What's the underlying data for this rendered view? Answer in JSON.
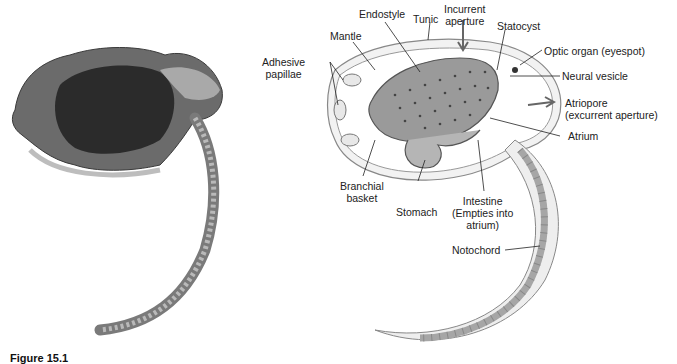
{
  "figure": {
    "caption": "Figure 15.1",
    "photo": {
      "description": "micrograph of tunicate larva"
    },
    "diagram": {
      "labels": {
        "adhesive_papillae": [
          "Adhesive",
          "papillae"
        ],
        "mantle": "Mantle",
        "endostyle": "Endostyle",
        "tunic": "Tunic",
        "incurrent_aperture": [
          "Incurrent",
          "aperture"
        ],
        "statocyst": "Statocyst",
        "optic_organ": "Optic organ (eyespot)",
        "neural_vesicle": "Neural vesicle",
        "atriopore": [
          "Atriopore",
          "(excurrent aperture)"
        ],
        "atrium": "Atrium",
        "branchial_basket": [
          "Branchial",
          "basket"
        ],
        "stomach": "Stomach",
        "intestine": [
          "Intestine",
          "(Empties into",
          "atrium)"
        ],
        "notochord": "Notochord"
      }
    }
  }
}
